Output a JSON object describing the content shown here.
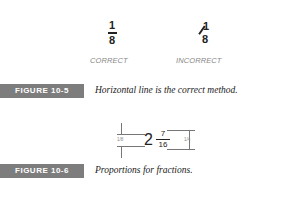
{
  "figure_10_5": {
    "correct": {
      "numerator": "1",
      "denominator": "8",
      "label": "CORRECT"
    },
    "incorrect": {
      "numerator": "1",
      "denominator": "8",
      "label": "INCORRECT"
    },
    "tag": "FIGURE 10-5",
    "caption": "Horizontal line is the correct method."
  },
  "figure_10_6": {
    "whole": "2",
    "numerator": "7",
    "denominator": "16",
    "left_dimension": "1/8",
    "right_dimension": "1/4",
    "tag": "FIGURE 10-6",
    "caption": "Proportions for fractions."
  }
}
